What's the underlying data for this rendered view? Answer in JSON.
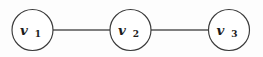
{
  "figure": {
    "type": "graph-diagram",
    "title": "",
    "background_color": "#fdfdfd",
    "node_fill": "#ffffff",
    "node_stroke": "#3a3a3a",
    "edge_color": "#555555",
    "label_color": "#1c1c1c"
  },
  "graph": {
    "nodes": [
      {
        "id": "v1",
        "base": "v",
        "subscript": "1",
        "cx": 32.5,
        "cy": 30,
        "r": 20.5
      },
      {
        "id": "v2",
        "base": "v",
        "subscript": "2",
        "cx": 130.5,
        "cy": 30,
        "r": 20.5
      },
      {
        "id": "v3",
        "base": "v",
        "subscript": "3",
        "cx": 229.0,
        "cy": 30,
        "r": 20.5
      }
    ],
    "edges": [
      {
        "id": "e12",
        "from": "v1",
        "to": "v2",
        "x1": 53,
        "y1": 30,
        "x2": 110,
        "y2": 30
      },
      {
        "id": "e23",
        "from": "v2",
        "to": "v3",
        "x1": 151,
        "y1": 30,
        "x2": 208,
        "y2": 30
      }
    ]
  }
}
